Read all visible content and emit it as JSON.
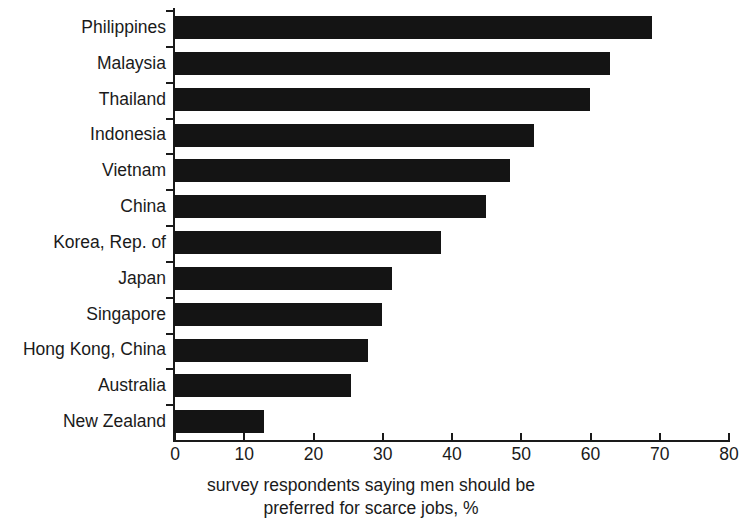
{
  "chart_data": {
    "type": "bar",
    "orientation": "horizontal",
    "title": "",
    "subtitle": "",
    "xlabel": "survey respondents saying men should be preferred for scarce jobs, %",
    "xlabel_line1": "survey respondents saying men should be",
    "xlabel_line2": "preferred for scarce jobs, %",
    "ylabel": "",
    "categories": [
      "Philippines",
      "Malaysia",
      "Thailand",
      "Indonesia",
      "Vietnam",
      "China",
      "Korea, Rep. of",
      "Japan",
      "Singapore",
      "Hong Kong, China",
      "Australia",
      "New Zealand"
    ],
    "values": [
      69,
      63,
      60,
      52,
      48.5,
      45,
      38.5,
      31.5,
      30,
      28,
      25.5,
      13
    ],
    "xlim": [
      0,
      80
    ],
    "xticks": [
      0,
      10,
      20,
      30,
      40,
      50,
      60,
      70,
      80
    ],
    "xtick_labels": [
      "0",
      "10",
      "20",
      "30",
      "40",
      "50",
      "60",
      "70",
      "80"
    ],
    "grid": false,
    "legend": null,
    "bar_color": "#141414",
    "axis_color": "#1a1a1a",
    "background_color": "#ffffff"
  }
}
